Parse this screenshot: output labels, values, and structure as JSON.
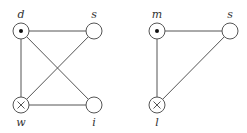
{
  "graphs": [
    {
      "name": "left-graph",
      "nodes": [
        {
          "id": "d",
          "label": "d",
          "marker": "dot",
          "x": 21,
          "y": 31
        },
        {
          "id": "s",
          "label": "s",
          "marker": "none",
          "x": 94,
          "y": 31
        },
        {
          "id": "w",
          "label": "w",
          "marker": "cross",
          "x": 21,
          "y": 105
        },
        {
          "id": "i",
          "label": "i",
          "marker": "none",
          "x": 94,
          "y": 105
        }
      ],
      "edges": [
        [
          "d",
          "s"
        ],
        [
          "d",
          "w"
        ],
        [
          "d",
          "i"
        ],
        [
          "s",
          "w"
        ],
        [
          "w",
          "i"
        ]
      ]
    },
    {
      "name": "right-graph",
      "nodes": [
        {
          "id": "m",
          "label": "m",
          "marker": "dot",
          "x": 157,
          "y": 31
        },
        {
          "id": "s",
          "label": "s",
          "marker": "none",
          "x": 230,
          "y": 31
        },
        {
          "id": "l",
          "label": "l",
          "marker": "cross",
          "x": 157,
          "y": 105
        }
      ],
      "edges": [
        [
          "m",
          "s"
        ],
        [
          "m",
          "l"
        ],
        [
          "s",
          "l"
        ]
      ]
    }
  ],
  "labels": {
    "d": "d",
    "s_left": "s",
    "w": "w",
    "i": "i",
    "m": "m",
    "s_right": "s",
    "l": "l"
  }
}
